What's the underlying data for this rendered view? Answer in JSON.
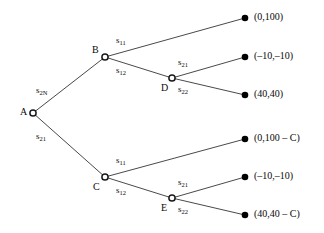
{
  "figure": {
    "type": "game-tree",
    "colors": {
      "line": "#1a1a1a",
      "text": "#0a0a0a",
      "terminal_fill": "#000000",
      "decision_fill": "#ffffff"
    }
  },
  "nodes": {
    "root": {
      "id": "A",
      "label": "A",
      "x": 33,
      "y": 113
    },
    "b": {
      "id": "B",
      "label": "B",
      "x": 105,
      "y": 57
    },
    "c": {
      "id": "C",
      "label": "C",
      "x": 105,
      "y": 177
    },
    "d": {
      "id": "D",
      "label": "D",
      "x": 172,
      "y": 78
    },
    "e": {
      "id": "E",
      "label": "E",
      "x": 172,
      "y": 198
    }
  },
  "terminals": [
    {
      "index": 0,
      "x": 245,
      "y": 18,
      "payoff": "(0,100)"
    },
    {
      "index": 1,
      "x": 245,
      "y": 57,
      "payoff": "(–10,–10)"
    },
    {
      "index": 2,
      "x": 245,
      "y": 95,
      "payoff": "(40,40)"
    },
    {
      "index": 3,
      "x": 245,
      "y": 139,
      "payoff": "(0,100 – C)"
    },
    {
      "index": 4,
      "x": 245,
      "y": 177,
      "payoff": "(–10,–10)"
    },
    {
      "index": 5,
      "x": 245,
      "y": 215,
      "payoff": "(40,40 – C)"
    }
  ],
  "actions": {
    "a_upper": {
      "base": "s",
      "sub": "2N",
      "x": 36,
      "y": 86
    },
    "a_lower": {
      "base": "s",
      "sub": "21",
      "x": 36,
      "y": 132
    },
    "b_upper": {
      "base": "s",
      "sub": "11",
      "x": 116,
      "y": 36
    },
    "b_lower": {
      "base": "s",
      "sub": "12",
      "x": 116,
      "y": 66
    },
    "d_upper": {
      "base": "s",
      "sub": "21",
      "x": 178,
      "y": 58
    },
    "d_lower": {
      "base": "s",
      "sub": "22",
      "x": 178,
      "y": 85
    },
    "c_upper": {
      "base": "s",
      "sub": "11",
      "x": 116,
      "y": 156
    },
    "c_lower": {
      "base": "s",
      "sub": "12",
      "x": 116,
      "y": 186
    },
    "e_upper": {
      "base": "s",
      "sub": "21",
      "x": 178,
      "y": 178
    },
    "e_lower": {
      "base": "s",
      "sub": "22",
      "x": 178,
      "y": 205
    }
  },
  "edges": [
    {
      "name": "A-to-B",
      "from": "A",
      "to": "B"
    },
    {
      "name": "A-to-C",
      "from": "A",
      "to": "C"
    },
    {
      "name": "B-to-t0",
      "from": "B",
      "to": "terminal-0"
    },
    {
      "name": "B-to-D",
      "from": "B",
      "to": "D"
    },
    {
      "name": "D-to-t1",
      "from": "D",
      "to": "terminal-1"
    },
    {
      "name": "D-to-t2",
      "from": "D",
      "to": "terminal-2"
    },
    {
      "name": "C-to-t3",
      "from": "C",
      "to": "terminal-3"
    },
    {
      "name": "C-to-E",
      "from": "C",
      "to": "E"
    },
    {
      "name": "E-to-t4",
      "from": "E",
      "to": "terminal-4"
    },
    {
      "name": "E-to-t5",
      "from": "E",
      "to": "terminal-5"
    }
  ]
}
